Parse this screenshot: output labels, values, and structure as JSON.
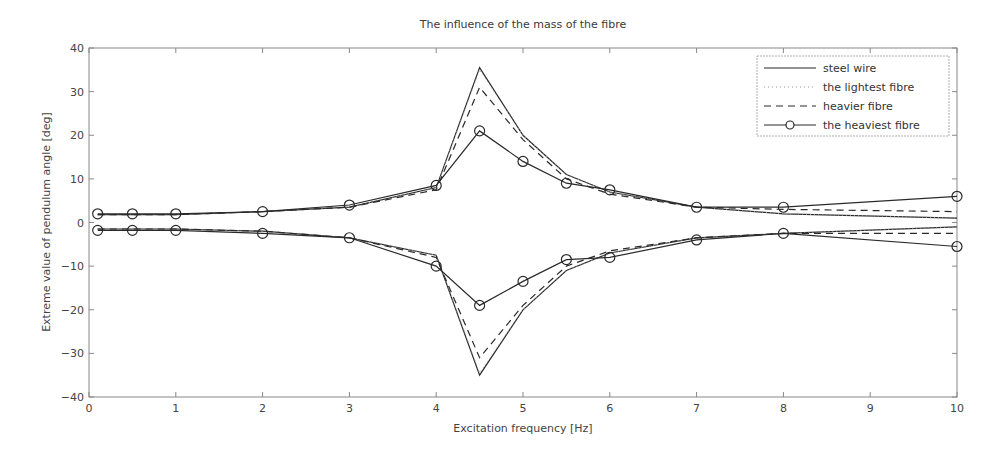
{
  "chart_data": {
    "type": "line",
    "title": "The influence of the mass of the fibre",
    "xlabel": "Excitation frequency [Hz]",
    "ylabel": "Extreme value of pendulum angle [deg]",
    "xlim": [
      0,
      10
    ],
    "ylim": [
      -40,
      40
    ],
    "xticks": [
      0,
      1,
      2,
      3,
      4,
      5,
      6,
      7,
      8,
      9,
      10
    ],
    "yticks": [
      -40,
      -30,
      -20,
      -10,
      0,
      10,
      20,
      30,
      40
    ],
    "grid": false,
    "legend_position": "upper right",
    "x": [
      0.1,
      0.5,
      1,
      2,
      3,
      4,
      4.5,
      5,
      5.5,
      6,
      7,
      8,
      10
    ],
    "series": [
      {
        "name": "steel wire",
        "style": "solid",
        "upper": [
          1.8,
          1.8,
          1.8,
          2.5,
          3.5,
          8,
          35.5,
          20,
          11,
          7,
          3.5,
          2,
          1
        ],
        "lower": [
          -1.5,
          -1.5,
          -1.5,
          -2,
          -3.5,
          -7.5,
          -35,
          -20,
          -11,
          -7,
          -3.5,
          -2.5,
          -1
        ]
      },
      {
        "name": "the lightest fibre",
        "style": "dotted",
        "upper": [
          1.8,
          1.8,
          1.8,
          2.5,
          3.5,
          8,
          35,
          20,
          11,
          7,
          3.5,
          2,
          1
        ],
        "lower": [
          -1.5,
          -1.5,
          -1.5,
          -2,
          -3.5,
          -7.5,
          -34.5,
          -20,
          -11,
          -7,
          -3.5,
          -2.5,
          -1
        ]
      },
      {
        "name": "heavier fibre",
        "style": "dashed",
        "upper": [
          1.8,
          1.8,
          1.8,
          2.5,
          3.5,
          7.5,
          31,
          19,
          10,
          6.5,
          3.5,
          3,
          2.5
        ],
        "lower": [
          -1.5,
          -1.5,
          -1.5,
          -2,
          -3.5,
          -8,
          -31,
          -19,
          -10,
          -6.5,
          -3.5,
          -2.5,
          -2.5
        ]
      },
      {
        "name": "the heaviest fibre",
        "style": "solid-circle",
        "upper": [
          2,
          2,
          2,
          2.5,
          4,
          8.5,
          21,
          14,
          9,
          7.5,
          3.5,
          3.5,
          6
        ],
        "lower": [
          -1.8,
          -1.8,
          -1.8,
          -2.5,
          -3.5,
          -10,
          -19,
          -13.5,
          -8.5,
          -8,
          -4,
          -2.5,
          -5.5
        ]
      }
    ]
  },
  "colors": {
    "line": "#2a2a2a",
    "axis": "#777777",
    "text": "#444444"
  }
}
